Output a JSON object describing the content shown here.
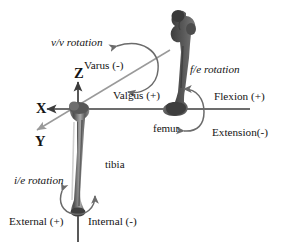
{
  "figure": {
    "background_color": "#ffffff",
    "bone_color": "#4a4a4a",
    "axis_color": "#3c3c3c",
    "y_axis_color": "#9a9a9a",
    "arrow_color": "#6b6b6b",
    "text_color": "#141414"
  },
  "axes": {
    "x": {
      "label": "X",
      "direction": "left",
      "description": "flexion/extension axis"
    },
    "y": {
      "label": "Y",
      "direction": "down-left diagonal",
      "description": "varus/valgus axis"
    },
    "z": {
      "label": "Z",
      "direction": "up",
      "description": "internal/external rotation axis"
    }
  },
  "bones": [
    {
      "name": "femur",
      "label": "femur"
    },
    {
      "name": "tibia",
      "label": "tibia"
    }
  ],
  "rotations": [
    {
      "id": "vv",
      "label": "v/v rotation",
      "axis": "Y",
      "positive": "Valgus (+)",
      "negative": "Varus (-)"
    },
    {
      "id": "fe",
      "label": "f/e rotation",
      "axis": "X",
      "positive": "Flexion (+)",
      "negative": "Extension(-)"
    },
    {
      "id": "ie",
      "label": "i/e rotation",
      "axis": "Z",
      "positive": "External (+)",
      "negative": "Internal (-)"
    }
  ]
}
